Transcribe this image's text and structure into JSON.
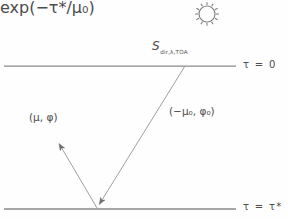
{
  "figure": {
    "background_color": "#fefefe",
    "line_color": "#8a8a8a",
    "ray_color": "#9a9a9a",
    "text_color": "#4c4c4c"
  },
  "sun": {
    "icon_name": "sun-icon",
    "center_x": 207,
    "center_y": 14,
    "radius": 8,
    "ray_count": 12
  },
  "boundaries": {
    "top": {
      "label_symbol": "τ",
      "label_equals": "=",
      "label_value": "0",
      "label_text": "τ = 0",
      "y": 66,
      "x_start": 4,
      "x_end": 236
    },
    "bottom": {
      "label_symbol": "τ",
      "label_equals": "=",
      "label_value": "τ*",
      "label_text": "τ = τ*",
      "y": 209,
      "x_start": 4,
      "x_end": 236
    }
  },
  "labels": {
    "source": {
      "symbol": "S",
      "subscript": "dir,λ,TOA",
      "full_text": "S dir,λ,TOA"
    },
    "incoming_direction": "(−μ₀, φ₀)",
    "outgoing_direction": "(μ, φ)",
    "transmittance": "exp(−τ*/μ₀)"
  },
  "rays": {
    "incoming": {
      "name": "incoming-solar-beam",
      "from_x": 185,
      "from_y": 66,
      "to_x": 97,
      "to_y": 208,
      "arrow_at": "end"
    },
    "outgoing": {
      "name": "reflected-upward-beam",
      "from_x": 97,
      "from_y": 208,
      "to_x": 57,
      "to_y": 140,
      "arrow_at": "end"
    },
    "surface_point": {
      "name": "scattering-point",
      "x": 97,
      "y": 209
    }
  }
}
